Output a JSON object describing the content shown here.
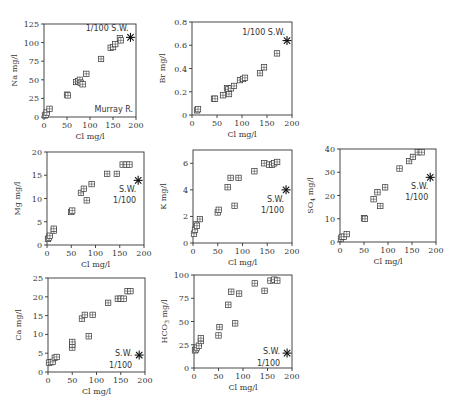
{
  "chart_data": [
    {
      "type": "scatter",
      "id": "na",
      "title": "",
      "xlabel": "Cl mg/l",
      "ylabel": "Na mg/l",
      "ylabel_sub": "",
      "xlim": [
        0,
        200
      ],
      "ylim": [
        0,
        125
      ],
      "xticks": [
        0,
        50,
        100,
        150,
        200
      ],
      "yticks": [
        0,
        25,
        50,
        75,
        100,
        125
      ],
      "frame": {
        "x0": 44,
        "x1": 136,
        "y0": 117,
        "y1": 24
      },
      "points": [
        [
          2,
          2
        ],
        [
          4,
          3
        ],
        [
          6,
          6
        ],
        [
          12,
          11
        ],
        [
          50,
          30
        ],
        [
          52,
          29
        ],
        [
          70,
          47
        ],
        [
          74,
          48
        ],
        [
          78,
          50
        ],
        [
          80,
          46
        ],
        [
          84,
          44
        ],
        [
          92,
          58
        ],
        [
          124,
          78
        ],
        [
          145,
          93
        ],
        [
          150,
          94
        ],
        [
          155,
          98
        ],
        [
          165,
          106
        ],
        [
          167,
          103
        ]
      ],
      "seawater": {
        "x": 188,
        "y": 107,
        "label": "1/100  S.W.",
        "label_pos": "above-left"
      },
      "annotation": "Murray R."
    },
    {
      "type": "scatter",
      "id": "br",
      "title": "",
      "xlabel": "Cl mg/l",
      "ylabel": "Br mg/l",
      "ylabel_sub": "",
      "xlim": [
        0,
        200
      ],
      "ylim": [
        0,
        0.8
      ],
      "xticks": [
        0,
        50,
        100,
        150,
        200
      ],
      "yticks": [
        0,
        0.2,
        0.4,
        0.6,
        0.8
      ],
      "frame": {
        "x0": 192,
        "x1": 292,
        "y0": 115,
        "y1": 22
      },
      "points": [
        [
          10,
          0.04
        ],
        [
          12,
          0.05
        ],
        [
          44,
          0.14
        ],
        [
          46,
          0.14
        ],
        [
          62,
          0.17
        ],
        [
          70,
          0.23
        ],
        [
          72,
          0.22
        ],
        [
          74,
          0.18
        ],
        [
          78,
          0.23
        ],
        [
          84,
          0.25
        ],
        [
          96,
          0.3
        ],
        [
          102,
          0.31
        ],
        [
          106,
          0.32
        ],
        [
          136,
          0.36
        ],
        [
          144,
          0.41
        ],
        [
          170,
          0.53
        ]
      ],
      "seawater": {
        "x": 190,
        "y": 0.64,
        "label": "1/100  S.W.",
        "label_pos": "above-left"
      }
    },
    {
      "type": "scatter",
      "id": "mg",
      "title": "",
      "xlabel": "Cl mg/l",
      "ylabel": "Mg mg/l",
      "ylabel_sub": "",
      "xlim": [
        0,
        200
      ],
      "ylim": [
        0,
        20
      ],
      "xticks": [
        0,
        50,
        100,
        150,
        200
      ],
      "yticks": [
        0,
        5,
        10,
        15,
        20
      ],
      "frame": {
        "x0": 47,
        "x1": 144,
        "y0": 245,
        "y1": 152
      },
      "points": [
        [
          2,
          1.3
        ],
        [
          4,
          1.6
        ],
        [
          6,
          2.0
        ],
        [
          14,
          3.1
        ],
        [
          14,
          3.5
        ],
        [
          50,
          7.1
        ],
        [
          52,
          7.4
        ],
        [
          70,
          11.2
        ],
        [
          76,
          12.1
        ],
        [
          82,
          9.6
        ],
        [
          92,
          13.1
        ],
        [
          124,
          15.3
        ],
        [
          144,
          15.3
        ],
        [
          156,
          17.3
        ],
        [
          164,
          17.3
        ],
        [
          170,
          17.3
        ]
      ],
      "seawater": {
        "x": 188,
        "y": 13.9,
        "label": "S.W.\n1/100",
        "label_pos": "below-left"
      }
    },
    {
      "type": "scatter",
      "id": "k",
      "title": "",
      "xlabel": "Cl mg/l",
      "ylabel": "K mg/l",
      "ylabel_sub": "",
      "xlim": [
        0,
        200
      ],
      "ylim": [
        0,
        7
      ],
      "xticks": [
        0,
        50,
        100,
        150,
        200
      ],
      "yticks": [
        0,
        2,
        4,
        6
      ],
      "frame": {
        "x0": 193,
        "x1": 292,
        "y0": 243,
        "y1": 150
      },
      "points": [
        [
          2,
          0.7
        ],
        [
          4,
          1.0
        ],
        [
          6,
          1.4
        ],
        [
          8,
          1.3
        ],
        [
          14,
          1.8
        ],
        [
          50,
          2.3
        ],
        [
          52,
          2.5
        ],
        [
          70,
          4.2
        ],
        [
          76,
          4.9
        ],
        [
          84,
          2.8
        ],
        [
          92,
          4.9
        ],
        [
          124,
          5.4
        ],
        [
          144,
          6.0
        ],
        [
          154,
          5.9
        ],
        [
          160,
          5.9
        ],
        [
          164,
          6.0
        ],
        [
          170,
          6.1
        ]
      ],
      "seawater": {
        "x": 188,
        "y": 4.0,
        "label": "S.W.\n1/100",
        "label_pos": "below-left"
      }
    },
    {
      "type": "scatter",
      "id": "so4",
      "title": "",
      "xlabel": "Cl mg/l",
      "ylabel": "SO",
      "ylabel_sub": "4",
      "ylabel_unit": " mg/l",
      "xlim": [
        0,
        200
      ],
      "ylim": [
        0,
        40
      ],
      "xticks": [
        0,
        50,
        100,
        150,
        200
      ],
      "yticks": [
        0,
        10,
        20,
        30,
        40
      ],
      "frame": {
        "x0": 340,
        "x1": 436,
        "y0": 242,
        "y1": 149
      },
      "points": [
        [
          2,
          1.5
        ],
        [
          4,
          2.2
        ],
        [
          8,
          2.3
        ],
        [
          14,
          3.4
        ],
        [
          50,
          10.2
        ],
        [
          52,
          10.0
        ],
        [
          70,
          18.4
        ],
        [
          78,
          21.4
        ],
        [
          84,
          15.5
        ],
        [
          94,
          23.5
        ],
        [
          124,
          31.6
        ],
        [
          144,
          34.8
        ],
        [
          152,
          36.6
        ],
        [
          162,
          38.6
        ],
        [
          170,
          38.6
        ]
      ],
      "seawater": {
        "x": 188,
        "y": 27.8,
        "label": "S.W.\n1/100",
        "label_pos": "below-left"
      }
    },
    {
      "type": "scatter",
      "id": "ca",
      "title": "",
      "xlabel": "Cl mg/l",
      "ylabel": "Ca mg/l",
      "ylabel_sub": "",
      "xlim": [
        0,
        200
      ],
      "ylim": [
        0,
        25
      ],
      "xticks": [
        0,
        50,
        100,
        150,
        200
      ],
      "yticks": [
        0,
        5,
        10,
        15,
        20,
        25
      ],
      "frame": {
        "x0": 48,
        "x1": 145,
        "y0": 372,
        "y1": 278
      },
      "points": [
        [
          2,
          2.5
        ],
        [
          6,
          2.6
        ],
        [
          10,
          2.7
        ],
        [
          14,
          3.8
        ],
        [
          18,
          4.0
        ],
        [
          50,
          6.5
        ],
        [
          50,
          7.3
        ],
        [
          50,
          8.0
        ],
        [
          70,
          14.2
        ],
        [
          76,
          15.2
        ],
        [
          84,
          9.5
        ],
        [
          92,
          15.2
        ],
        [
          124,
          18.4
        ],
        [
          144,
          19.5
        ],
        [
          150,
          19.5
        ],
        [
          156,
          19.5
        ],
        [
          164,
          21.5
        ],
        [
          170,
          21.5
        ]
      ],
      "seawater": {
        "x": 188,
        "y": 4.5,
        "label": "S.W.\n1/100",
        "label_pos": "left"
      }
    },
    {
      "type": "scatter",
      "id": "hco3",
      "title": "",
      "xlabel": "Cl mg/l",
      "ylabel": "HCO",
      "ylabel_sub": "3",
      "ylabel_unit": " mg/l",
      "xlim": [
        0,
        200
      ],
      "ylim": [
        0,
        100
      ],
      "xticks": [
        0,
        50,
        100,
        150,
        200
      ],
      "yticks": [
        0,
        25,
        50,
        75,
        100
      ],
      "frame": {
        "x0": 194,
        "x1": 292,
        "y0": 368,
        "y1": 275
      },
      "points": [
        [
          2,
          19
        ],
        [
          4,
          20
        ],
        [
          6,
          22
        ],
        [
          10,
          24
        ],
        [
          14,
          29
        ],
        [
          14,
          32
        ],
        [
          50,
          35
        ],
        [
          52,
          44
        ],
        [
          70,
          68
        ],
        [
          76,
          82
        ],
        [
          84,
          48
        ],
        [
          92,
          80
        ],
        [
          124,
          91
        ],
        [
          144,
          83
        ],
        [
          156,
          94
        ],
        [
          164,
          95
        ],
        [
          170,
          94
        ]
      ],
      "seawater": {
        "x": 190,
        "y": 16,
        "label": "S.W.\n1/100",
        "label_pos": "left"
      }
    }
  ]
}
